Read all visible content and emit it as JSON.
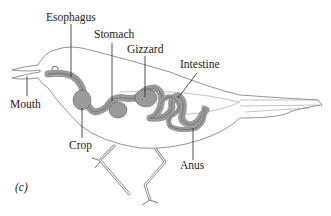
{
  "figure": {
    "panel_label": "(c)",
    "labels": [
      {
        "id": "esophagus",
        "text": "Esophagus"
      },
      {
        "id": "stomach",
        "text": "Stomach"
      },
      {
        "id": "gizzard",
        "text": "Gizzard"
      },
      {
        "id": "intestine",
        "text": "Intestine"
      },
      {
        "id": "mouth",
        "text": "Mouth"
      },
      {
        "id": "crop",
        "text": "Crop"
      },
      {
        "id": "anus",
        "text": "Anus"
      }
    ],
    "colors": {
      "organ_fill": "#9a9a9a",
      "outline": "#555555",
      "line": "#222222"
    }
  }
}
